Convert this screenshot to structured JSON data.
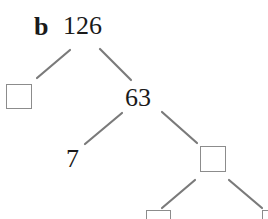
{
  "diagram": {
    "type": "factor-tree",
    "part_label": "b",
    "root": {
      "value": "126"
    },
    "nodes": {
      "left_blank": {
        "value": "",
        "blank": true
      },
      "n63": {
        "value": "63"
      },
      "n7": {
        "value": "7"
      },
      "mid_blank": {
        "value": "",
        "blank": true
      },
      "bottom_left_blank": {
        "value": "",
        "blank": true
      },
      "bottom_right_blank": {
        "value": "",
        "blank": true
      }
    },
    "edges": [
      [
        "126",
        "left_blank"
      ],
      [
        "126",
        "63"
      ],
      [
        "63",
        "7"
      ],
      [
        "63",
        "mid_blank"
      ],
      [
        "mid_blank",
        "bottom_left_blank"
      ],
      [
        "mid_blank",
        "bottom_right_blank"
      ]
    ],
    "colors": {
      "line": "#7a7a7a",
      "text": "#1a1a1a",
      "box_border": "#8c8c8c"
    }
  }
}
